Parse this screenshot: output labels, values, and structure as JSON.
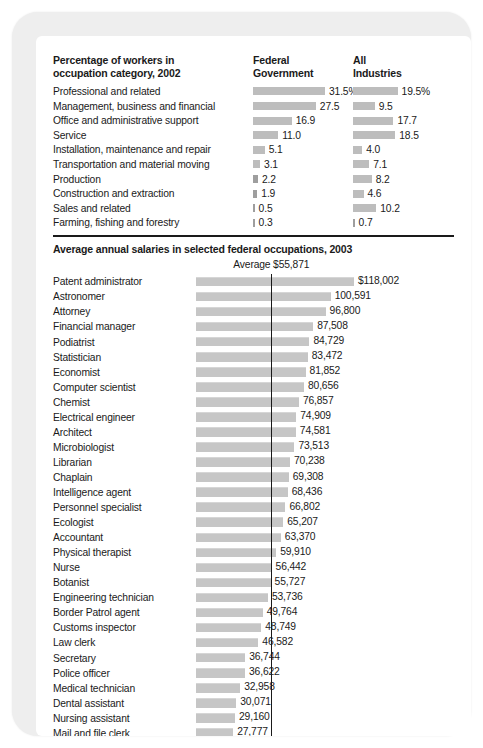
{
  "occupation_table": {
    "title_line1": "Percentage of workers in",
    "title_line2": "occupation category, 2002",
    "col_fed_line1": "Federal",
    "col_fed_line2": "Government",
    "col_all_line1": "All",
    "col_all_line2": "Industries",
    "rows": [
      {
        "label": "Professional and related",
        "federal": "31.5%",
        "all": "19.5%",
        "federal_value": 31.5,
        "all_value": 19.5
      },
      {
        "label": "Management, business and financial",
        "federal": "27.5",
        "all": "9.5",
        "federal_value": 27.5,
        "all_value": 9.5
      },
      {
        "label": "Office and administrative support",
        "federal": "16.9",
        "all": "17.7",
        "federal_value": 16.9,
        "all_value": 17.7
      },
      {
        "label": "Service",
        "federal": "11.0",
        "all": "18.5",
        "federal_value": 11.0,
        "all_value": 18.5
      },
      {
        "label": "Installation, maintenance and repair",
        "federal": "5.1",
        "all": "4.0",
        "federal_value": 5.1,
        "all_value": 4.0
      },
      {
        "label": "Transportation and material moving",
        "federal": "3.1",
        "all": "7.1",
        "federal_value": 3.1,
        "all_value": 7.1
      },
      {
        "label": "Production",
        "federal": "2.2",
        "all": "8.2",
        "federal_value": 2.2,
        "all_value": 8.2
      },
      {
        "label": "Construction and extraction",
        "federal": "1.9",
        "all": "4.6",
        "federal_value": 1.9,
        "all_value": 4.6
      },
      {
        "label": "Sales and related",
        "federal": "0.5",
        "all": "10.2",
        "federal_value": 0.5,
        "all_value": 10.2
      },
      {
        "label": "Farming, fishing and forestry",
        "federal": "0.3",
        "all": "0.7",
        "federal_value": 0.3,
        "all_value": 0.7
      }
    ]
  },
  "salary_section": {
    "title": "Average annual salaries in selected federal occupations, 2003",
    "average_caption": "Average $55,871",
    "average_value": 55871
  },
  "chart_data": {
    "type": "bar",
    "orientation": "horizontal",
    "title": "Average annual salaries in selected federal occupations, 2003",
    "xlabel": "",
    "ylabel": "",
    "annotation": "Average $55,871",
    "reference_line": 55871,
    "grid": false,
    "legend": null,
    "categories": [
      "Patent administrator",
      "Astronomer",
      "Attorney",
      "Financial manager",
      "Podiatrist",
      "Statistician",
      "Economist",
      "Computer scientist",
      "Chemist",
      "Electrical engineer",
      "Architect",
      "Microbiologist",
      "Librarian",
      "Chaplain",
      "Intelligence agent",
      "Personnel specialist",
      "Ecologist",
      "Accountant",
      "Physical therapist",
      "Nurse",
      "Botanist",
      "Engineering technician",
      "Border Patrol agent",
      "Customs inspector",
      "Law clerk",
      "Secretary",
      "Police officer",
      "Medical technician",
      "Dental assistant",
      "Nursing assistant",
      "Mail and file clerk"
    ],
    "values": [
      118002,
      100591,
      96800,
      87508,
      84729,
      83472,
      81852,
      80656,
      76857,
      74909,
      74581,
      73513,
      70238,
      69308,
      68436,
      66802,
      65207,
      63370,
      59910,
      56442,
      55727,
      53736,
      49764,
      48749,
      46582,
      36744,
      36622,
      32958,
      30071,
      29160,
      27777
    ],
    "labels": [
      "$118,002",
      "100,591",
      "96,800",
      "87,508",
      "84,729",
      "83,472",
      "81,852",
      "80,656",
      "76,857",
      "74,909",
      "74,581",
      "73,513",
      "70,238",
      "69,308",
      "68,436",
      "66,802",
      "65,207",
      "63,370",
      "59,910",
      "56,442",
      "55,727",
      "53,736",
      "49,764",
      "48,749",
      "46,582",
      "36,744",
      "36,622",
      "32,958",
      "30,071",
      "29,160",
      "27,777"
    ],
    "xlim": [
      0,
      118002
    ]
  },
  "secondary_chart_data": {
    "type": "bar",
    "orientation": "horizontal",
    "title": "Percentage of workers in occupation category, 2002",
    "series": [
      {
        "name": "Federal Government",
        "values": [
          31.5,
          27.5,
          16.9,
          11.0,
          5.1,
          3.1,
          2.2,
          1.9,
          0.5,
          0.3
        ]
      },
      {
        "name": "All Industries",
        "values": [
          19.5,
          9.5,
          17.7,
          18.5,
          4.0,
          7.1,
          8.2,
          4.6,
          10.2,
          0.7
        ]
      }
    ],
    "categories": [
      "Professional and related",
      "Management, business and financial",
      "Office and administrative support",
      "Service",
      "Installation, maintenance and repair",
      "Transportation and material moving",
      "Production",
      "Construction and extraction",
      "Sales and related",
      "Farming, fishing and forestry"
    ],
    "xlim": [
      0,
      31.5
    ],
    "grid": false
  },
  "colors": {
    "bar_percent": "#bdbdbd",
    "bar_salary": "#c6c6c6",
    "rule": "#1a1a1a",
    "text": "#1a1a1a",
    "card_frame": "#eeeeee",
    "page_bg": "#ffffff"
  }
}
